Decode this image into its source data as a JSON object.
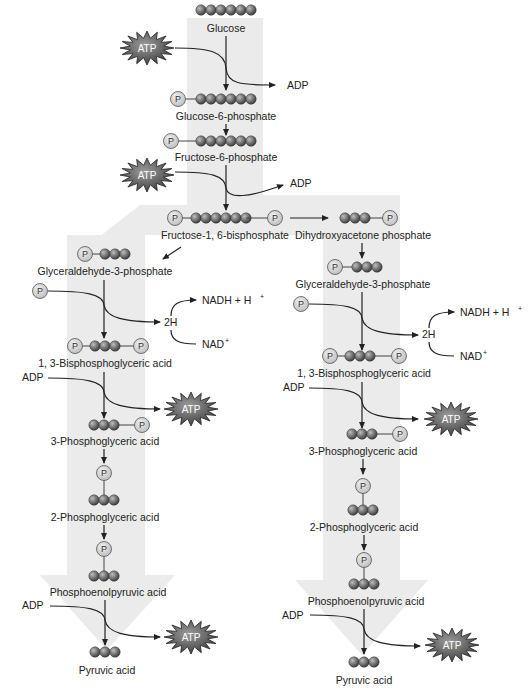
{
  "colors": {
    "band": "#e8e8e8",
    "carbon": "#6a6a6a",
    "phosphate_fill": "#d0d0d0",
    "atp_fill": "#555555",
    "line": "#222222"
  },
  "molecules": {
    "glucose": "Glucose",
    "g6p": "Glucose-6-phosphate",
    "f6p": "Fructose-6-phosphate",
    "f16bp": "Fructose-1, 6-bisphosphate",
    "dhap": "Dihydroxyacetone phosphate",
    "g3p_left": "Glyceraldehyde-3-phosphate",
    "g3p_right": "Glyceraldehyde-3-phosphate",
    "bpg_left": "1, 3-Bisphosphoglyceric acid",
    "bpg_right": "1, 3-Bisphosphoglyceric acid",
    "pg3_left": "3-Phosphoglyceric acid",
    "pg3_right": "3-Phosphoglyceric acid",
    "pg2_left": "2-Phosphoglyceric acid",
    "pg2_right": "2-Phosphoglyceric acid",
    "pep_left": "Phosphoenolpyruvic acid",
    "pep_right": "Phosphoenolpyruvic acid",
    "pyr_left": "Pyruvic acid",
    "pyr_right": "Pyruvic acid"
  },
  "cofactors": {
    "atp": "ATP",
    "adp": "ADP",
    "p": "P",
    "two_h": "2H",
    "nadh": "NADH + H",
    "nadh_sup": "+",
    "nad": "NAD",
    "nad_sup": "+"
  }
}
